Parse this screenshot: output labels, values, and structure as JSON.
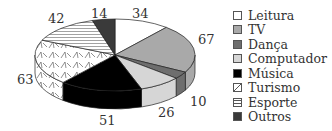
{
  "chart_data": {
    "type": "pie",
    "style": "3d-exploded-none",
    "title": "",
    "categories": [
      "Leitura",
      "TV",
      "Dança",
      "Computador",
      "Música",
      "Turismo",
      "Esporte",
      "Outros"
    ],
    "values": [
      34,
      67,
      10,
      26,
      51,
      63,
      42,
      14
    ],
    "colors": [
      "#ffffff",
      "#a9a9a9",
      "#6e6e6e",
      "#d6d6d6",
      "#000000",
      "pattern-zigzag",
      "pattern-hlines",
      "#3a3a3a"
    ],
    "legend_position": "right"
  },
  "labels": {
    "leitura": "34",
    "tv": "67",
    "danca": "10",
    "computador": "26",
    "musica": "51",
    "turismo": "63",
    "esporte": "42",
    "outros": "14"
  },
  "legend": [
    {
      "label": "Leitura"
    },
    {
      "label": "TV"
    },
    {
      "label": "Dança"
    },
    {
      "label": "Computador"
    },
    {
      "label": "Música"
    },
    {
      "label": "Turismo"
    },
    {
      "label": "Esporte"
    },
    {
      "label": "Outros"
    }
  ]
}
